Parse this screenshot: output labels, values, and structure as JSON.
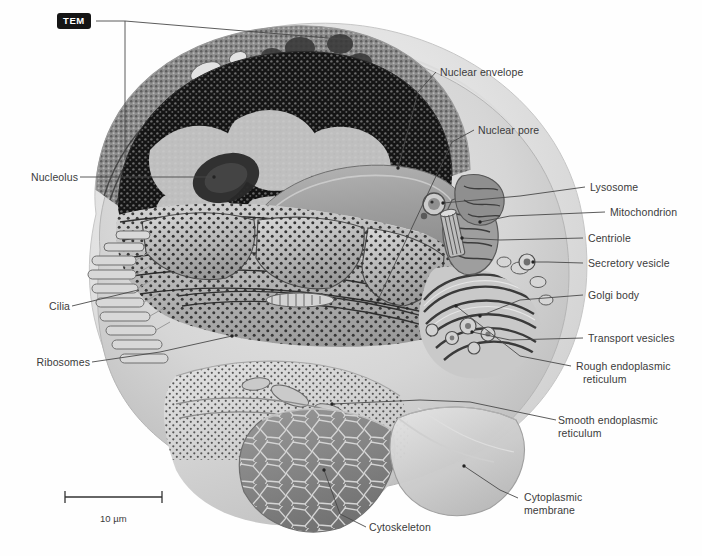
{
  "figure": {
    "technique_badge": "TEM",
    "scale_bar": {
      "label": "10 µm",
      "length_px": 97
    },
    "background_color": "#fefefe",
    "line_color": "#4a4a4a",
    "text_color": "#3b3b3b"
  },
  "labels": {
    "nuclear_envelope": "Nuclear envelope",
    "nuclear_pore": "Nuclear pore",
    "lysosome": "Lysosome",
    "mitochondrion": "Mitochondrion",
    "centriole": "Centriole",
    "secretory_vesicle": "Secretory vesicle",
    "golgi_body": "Golgi body",
    "transport_vesicles": "Transport vesicles",
    "rough_er_line1": "Rough endoplasmic",
    "rough_er_line2": "reticulum",
    "smooth_er_line1": "Smooth endoplasmic",
    "smooth_er_line2": "reticulum",
    "nucleolus": "Nucleolus",
    "cilia": "Cilia",
    "ribosomes": "Ribosomes",
    "cytoskeleton": "Cytoskeleton",
    "cytoplasmic_membrane_line1": "Cytoplasmic",
    "cytoplasmic_membrane_line2": "membrane"
  },
  "diagram": {
    "type": "labeled-illustration",
    "structures": [
      "cytoplasmic membrane",
      "cytoskeleton",
      "nucleus with nucleolus and chromatin",
      "nuclear envelope with nuclear pores",
      "rough endoplasmic reticulum with ribosomes",
      "smooth endoplasmic reticulum",
      "golgi body",
      "transport vesicles",
      "secretory vesicle",
      "lysosome",
      "mitochondrion",
      "centriole",
      "cilia"
    ]
  }
}
